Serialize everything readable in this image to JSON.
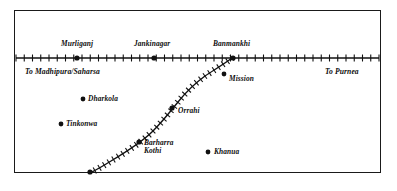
{
  "map": {
    "title": "Railway line sketch map",
    "frame": {
      "stroke": "#1a1a1a"
    },
    "ink": "#111111",
    "main_line": {
      "name": "main-railway-line",
      "orientation": "horizontal",
      "y": 58,
      "x_start": 16,
      "x_end": 379,
      "sleeper_count": 44,
      "sleeper_height": 7
    },
    "branch_line": {
      "name": "branch-railway-line",
      "description": "branch curving south-west from Banmankhi",
      "sleeper_count": 34,
      "path": "M 232,58 C 224,64 214,70 205,76 C 194,84 186,92 178,102 C 170,112 162,122 153,131 C 142,142 126,152 111,161 C 103,166 96,170 90,173"
    },
    "stations": [
      {
        "label": "Murliganj",
        "x": 77,
        "y": 58,
        "label_x": 61,
        "label_y": 40
      },
      {
        "label": "Jankinagar",
        "x": 154,
        "y": 58,
        "label_x": 134,
        "label_y": 40
      },
      {
        "label": "Banmankhi",
        "x": 233,
        "y": 58,
        "label_x": 213,
        "label_y": 40
      }
    ],
    "branch_stations": [
      {
        "label": "Orrahi",
        "x": 172,
        "y": 108,
        "label_x": 178,
        "label_y": 107,
        "lines": [
          "Orrahi"
        ]
      },
      {
        "label": "Barharra Kothi",
        "x": 139,
        "y": 142,
        "label_x": 144,
        "label_y": 139,
        "lines": [
          "Barharra",
          "Kothi"
        ]
      },
      {
        "label": "",
        "x": 90,
        "y": 172,
        "label_x": 0,
        "label_y": 0,
        "lines": []
      }
    ],
    "villages": [
      {
        "label": "Dharkola",
        "x": 83,
        "y": 99,
        "label_x": 88,
        "label_y": 95
      },
      {
        "label": "Tinkonwa",
        "x": 61,
        "y": 124,
        "label_x": 66,
        "label_y": 120
      },
      {
        "label": "Mission",
        "x": 224,
        "y": 74,
        "label_x": 229,
        "label_y": 75
      },
      {
        "label": "Khanua",
        "x": 208,
        "y": 152,
        "label_x": 214,
        "label_y": 148
      }
    ],
    "directions": [
      {
        "label": "To Madhipura/Saharsa",
        "x": 25,
        "y": 68
      },
      {
        "label": "To Purnea",
        "x": 325,
        "y": 68
      }
    ]
  }
}
